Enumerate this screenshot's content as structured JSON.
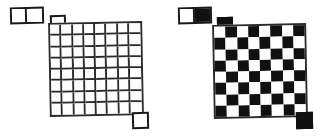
{
  "figure": {
    "background_color": "#ffffff",
    "line_color": "#2b2b2b",
    "dark_color": "#111111",
    "light_color": "#fdfdfd"
  },
  "panels": [
    {
      "id": "left",
      "name": "plain-grid-panel",
      "domino": {
        "label": "domino-plain",
        "cells": [
          "white",
          "white"
        ],
        "x": 10,
        "y": 7,
        "width": 34,
        "height": 17
      },
      "loose_square_top": {
        "label": "loose-square-top-plain",
        "fill": "white",
        "x": 50,
        "y": 15,
        "width": 16,
        "height": 16
      },
      "loose_square_bottom": {
        "label": "loose-square-bottom-plain",
        "fill": "white",
        "x": 132,
        "y": 112,
        "width": 17,
        "height": 17
      },
      "board": {
        "label": "plain-board",
        "rows": 8,
        "columns": 8,
        "x": 49,
        "y": 22,
        "width": 94,
        "height": 94,
        "style": "outline"
      }
    },
    {
      "id": "right",
      "name": "checkerboard-panel",
      "domino": {
        "label": "domino-checkered",
        "cells": [
          "white",
          "black"
        ],
        "x": 14,
        "y": 7,
        "width": 34,
        "height": 17
      },
      "loose_square_top": {
        "label": "loose-square-top-checkered",
        "fill": "black",
        "x": 53,
        "y": 17,
        "width": 16,
        "height": 16
      },
      "loose_square_bottom": {
        "label": "loose-square-bottom-checkered",
        "fill": "black",
        "x": 132,
        "y": 112,
        "width": 17,
        "height": 17
      },
      "board": {
        "label": "checker-board",
        "rows": 8,
        "columns": 8,
        "x": 49,
        "y": 24,
        "width": 94,
        "height": 94,
        "style": "checkered",
        "top_left_cell": "light"
      }
    }
  ],
  "chart_data": {
    "type": "diagram",
    "boards": [
      {
        "name": "plain-board",
        "rows": 8,
        "columns": 8,
        "coloring": "none"
      },
      {
        "name": "checker-board",
        "rows": 8,
        "columns": 8,
        "coloring": "alternating",
        "top_left_cell": "light"
      }
    ],
    "loose_pieces": [
      {
        "name": "domino-plain",
        "shape": "1x2",
        "colors": [
          "white",
          "white"
        ]
      },
      {
        "name": "loose-square-top-plain",
        "shape": "1x1",
        "colors": [
          "white"
        ]
      },
      {
        "name": "loose-square-bottom-plain",
        "shape": "1x1",
        "colors": [
          "white"
        ]
      },
      {
        "name": "domino-checkered",
        "shape": "1x2",
        "colors": [
          "white",
          "black"
        ]
      },
      {
        "name": "loose-square-top-checkered",
        "shape": "1x1",
        "colors": [
          "black"
        ]
      },
      {
        "name": "loose-square-bottom-checkered",
        "shape": "1x1",
        "colors": [
          "black"
        ]
      }
    ]
  }
}
